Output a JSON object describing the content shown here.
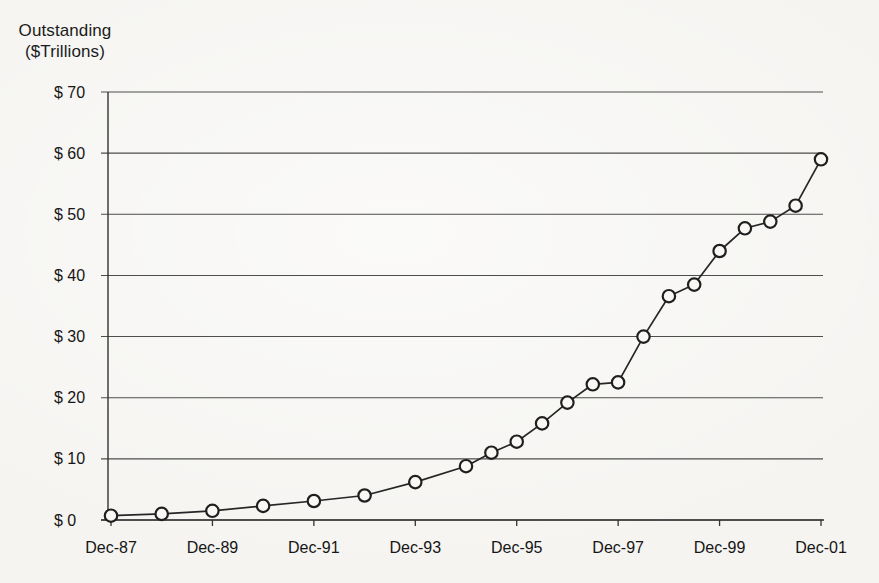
{
  "title": {
    "line1": "Outstanding",
    "line2": "($Trillions)"
  },
  "chart_data": {
    "type": "line",
    "title": "Outstanding ($Trillions)",
    "ylabel": "Outstanding ($Trillions)",
    "xlabel": "",
    "categories": [
      "Dec-87",
      "Dec-88",
      "Dec-89",
      "Dec-90",
      "Dec-91",
      "Dec-92",
      "Dec-93",
      "Dec-94",
      "Jun-95",
      "Dec-95",
      "Jun-96",
      "Dec-96",
      "Jun-97",
      "Dec-97",
      "Jun-98",
      "Dec-98",
      "Jun-99",
      "Dec-99",
      "Jun-00",
      "Dec-00",
      "Jun-01",
      "Dec-01"
    ],
    "values": [
      0.7,
      1.0,
      1.5,
      2.3,
      3.1,
      4.0,
      6.2,
      8.8,
      11.0,
      12.8,
      15.8,
      19.2,
      22.2,
      22.5,
      30.0,
      36.6,
      38.5,
      44.0,
      47.7,
      48.8,
      51.4,
      59.0
    ],
    "x_tick_labels": [
      "Dec-87",
      "Dec-89",
      "Dec-91",
      "Dec-93",
      "Dec-95",
      "Dec-97",
      "Dec-99",
      "Dec-01"
    ],
    "y_ticks": [
      0,
      10,
      20,
      30,
      40,
      50,
      60,
      70
    ],
    "y_tick_prefix": "$",
    "ylim": [
      0,
      70
    ],
    "grid": "horizontal-only",
    "legend": "none",
    "marker": "open-circle",
    "colors": {
      "line": "#262626",
      "marker_fill": "#f9f8f5",
      "marker_stroke": "#1f1f1f",
      "grid": "#4d4d4d",
      "axis": "#333333",
      "text": "#161616"
    }
  }
}
